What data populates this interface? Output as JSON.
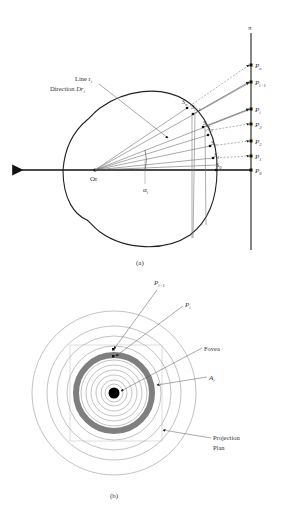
{
  "figure_a": {
    "caption": "(a)",
    "axis_label": "π",
    "origin_label": "Or",
    "angle_label": "α",
    "angle_sub": "i",
    "line_label": "Line r",
    "line_sub": "i",
    "direction_label": "Direction ",
    "direction_var": "Dr",
    "direction_sub": "i",
    "sphere_points": [
      {
        "name": "S",
        "sub": "n"
      },
      {
        "name": "S",
        "sub": "i+1"
      },
      {
        "name": "S",
        "sub": "i"
      },
      {
        "name": "S",
        "sub": "3"
      },
      {
        "name": "S",
        "sub": "2"
      },
      {
        "name": "S",
        "sub": "1"
      },
      {
        "name": "S",
        "sub": "0"
      }
    ],
    "projection_points": [
      {
        "name": "P",
        "sub": "n"
      },
      {
        "name": "P",
        "sub": "i+1"
      },
      {
        "name": "P",
        "sub": "i"
      },
      {
        "name": "P",
        "sub": "3"
      },
      {
        "name": "P",
        "sub": "2"
      },
      {
        "name": "P",
        "sub": "1"
      },
      {
        "name": "P",
        "sub": "0"
      }
    ]
  },
  "figure_b": {
    "caption": "(b)",
    "labels": {
      "p_i1": "P",
      "p_i1_sub": "i+1",
      "p_i": "P",
      "p_i_sub": "i",
      "fovea": "Fovea",
      "a_i": "A",
      "a_i_sub": "i",
      "projection_line1": "Projection",
      "projection_line2": "Plan"
    }
  },
  "colors": {
    "stroke": "#222222",
    "light_stroke": "#888888",
    "ring_fill": "#808080",
    "fovea_fill": "#000000"
  }
}
